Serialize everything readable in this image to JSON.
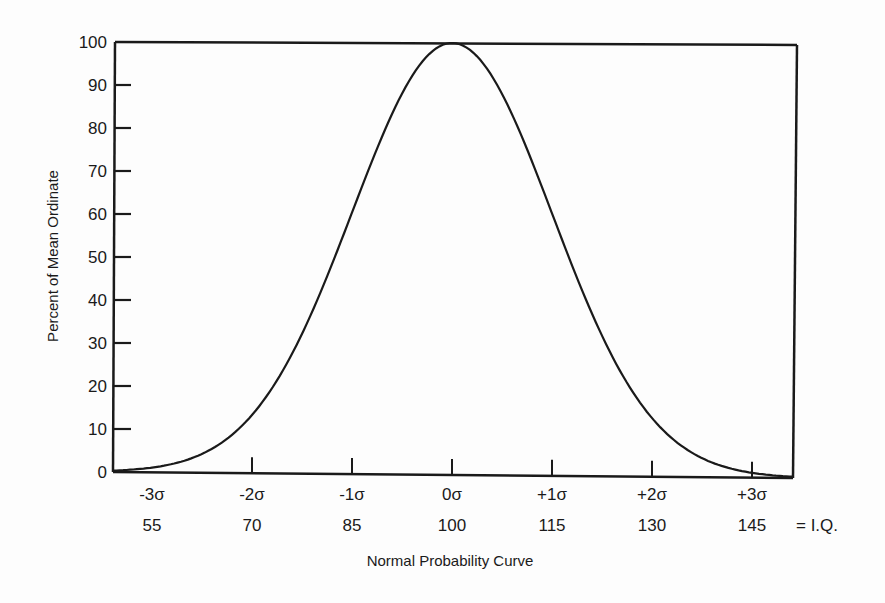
{
  "chart_data": {
    "type": "line",
    "title": "Normal Probability Curve",
    "xlabel": "Normal Probability Curve",
    "ylabel": "Percent of Mean Ordinate",
    "ylim": [
      0,
      100
    ],
    "yticks": [
      0,
      10,
      20,
      30,
      40,
      50,
      60,
      70,
      80,
      90,
      100
    ],
    "xticks": [
      {
        "sigma": "-3σ",
        "iq": "55",
        "z": -3
      },
      {
        "sigma": "-2σ",
        "iq": "70",
        "z": -2
      },
      {
        "sigma": "-1σ",
        "iq": "85",
        "z": -1
      },
      {
        "sigma": "0σ",
        "iq": "100",
        "z": 0
      },
      {
        "sigma": "+1σ",
        "iq": "115",
        "z": 1
      },
      {
        "sigma": "+2σ",
        "iq": "130",
        "z": 2
      },
      {
        "sigma": "+3σ",
        "iq": "145",
        "z": 3
      }
    ],
    "x_suffix_label": "= I.Q.",
    "grid": false,
    "series": [
      {
        "name": "Normal curve (percent of mean ordinate)",
        "x": [
          -3.4,
          -3,
          -2.5,
          -2,
          -1.5,
          -1,
          -0.5,
          0,
          0.5,
          1,
          1.5,
          2,
          2.5,
          3,
          3.4
        ],
        "values": [
          0.3,
          1.1,
          4.4,
          13.5,
          32.5,
          60.7,
          88.2,
          100,
          88.2,
          60.7,
          32.5,
          13.5,
          4.4,
          1.1,
          0.3
        ]
      }
    ]
  }
}
